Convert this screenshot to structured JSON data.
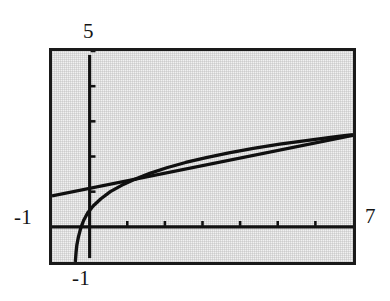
{
  "figure": {
    "kind": "mathematica-plot",
    "background_color": "#ffffff",
    "plot_background_color": "#f1f1f1",
    "frame_color": "#1a1a1a",
    "curve_color": "#101010"
  },
  "labels": {
    "y_max": "5",
    "y_min": "-1",
    "x_min": "-1",
    "x_max": "7"
  },
  "chart_data": {
    "type": "line",
    "title": "",
    "xlabel": "",
    "ylabel": "",
    "xlim": [
      -1,
      7
    ],
    "ylim": [
      -1,
      5
    ],
    "grid": false,
    "legend": null,
    "xticks": [
      1,
      2,
      3,
      4,
      5,
      6
    ],
    "xtick_labels": [
      "",
      "",
      "",
      "",
      "",
      ""
    ],
    "yticks": [
      1,
      2,
      3,
      4,
      5
    ],
    "ytick_labels": [
      "",
      "",
      "",
      "",
      ""
    ],
    "axes_style": "crossed-at-origin",
    "series": [
      {
        "name": "logarithmic-curve",
        "type": "line",
        "points": [
          [
            -0.38,
            -1.0
          ],
          [
            -0.36,
            -0.72
          ],
          [
            -0.34,
            -0.52
          ],
          [
            -0.3,
            -0.3
          ],
          [
            -0.24,
            -0.05
          ],
          [
            -0.16,
            0.18
          ],
          [
            -0.05,
            0.4
          ],
          [
            0.1,
            0.6
          ],
          [
            0.3,
            0.8
          ],
          [
            0.55,
            1.0
          ],
          [
            0.85,
            1.18
          ],
          [
            1.2,
            1.35
          ],
          [
            1.6,
            1.52
          ],
          [
            2.05,
            1.68
          ],
          [
            2.55,
            1.83
          ],
          [
            3.1,
            1.97
          ],
          [
            3.7,
            2.1
          ],
          [
            4.35,
            2.23
          ],
          [
            5.05,
            2.35
          ],
          [
            5.8,
            2.46
          ],
          [
            6.6,
            2.57
          ],
          [
            7.0,
            2.62
          ]
        ]
      },
      {
        "name": "straight-line",
        "type": "line",
        "points": [
          [
            -1.0,
            0.88
          ],
          [
            7.0,
            2.6
          ]
        ]
      }
    ]
  }
}
